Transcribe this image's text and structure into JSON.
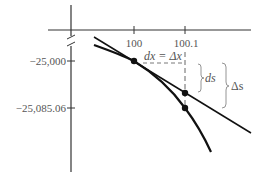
{
  "diagram": {
    "type": "tangent-line-approximation",
    "x_axis": {
      "ticks": [
        {
          "label": "100",
          "x": 134
        },
        {
          "label": "100.1",
          "x": 185
        }
      ]
    },
    "y_axis": {
      "ticks": [
        {
          "label": "−25,000",
          "y": 61
        },
        {
          "label": "−25,085.06",
          "y": 108
        }
      ],
      "has_axis_break": true
    },
    "annotations": {
      "dx_label": "dx = Δx",
      "ds_label": "ds",
      "delta_s_label": "Δs"
    },
    "colors": {
      "curve": "#111111",
      "axis": "#333333",
      "label": "#555555",
      "brace": "#888888"
    }
  }
}
